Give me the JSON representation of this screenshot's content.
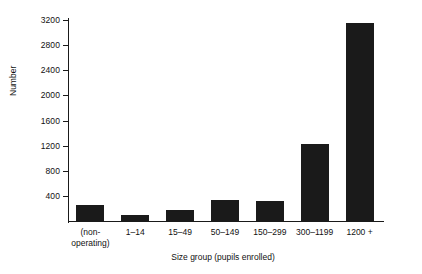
{
  "chart_data": {
    "type": "bar",
    "title": "",
    "xlabel": "Size group (pupils enrolled)",
    "ylabel": "Number",
    "categories": [
      "(non-operating)",
      "1–14",
      "15–49",
      "50–149",
      "150–299",
      "300–1199",
      "1200 +"
    ],
    "category_lines": [
      [
        "(non-",
        "operating)"
      ],
      [
        "1–14",
        ""
      ],
      [
        "15–49",
        ""
      ],
      [
        "50–149",
        ""
      ],
      [
        "150–299",
        ""
      ],
      [
        "300–1199",
        ""
      ],
      [
        "1200 +",
        ""
      ]
    ],
    "values": [
      250,
      100,
      170,
      330,
      320,
      1225,
      3150
    ],
    "ylim": [
      0,
      3200
    ],
    "yticks": [
      400,
      800,
      1200,
      1600,
      2000,
      2400,
      2800,
      3200
    ],
    "ytick_labels": [
      "400",
      "800",
      "1200",
      "1600",
      "2000",
      "2400",
      "2800",
      "3200"
    ],
    "grid": false,
    "legend": null,
    "bar_color": "#1a1a1a",
    "axis_color": "#1a1a1a",
    "background": "#ffffff"
  }
}
